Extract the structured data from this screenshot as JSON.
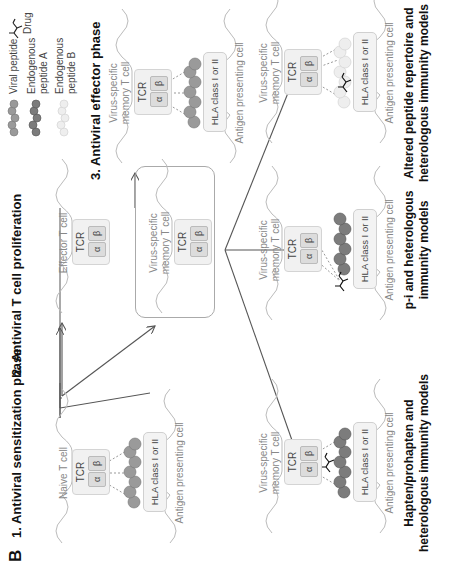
{
  "panel_letter": "B",
  "phases": {
    "phase1_title": "1. Antiviral sensitization phase",
    "phase2_title": "2. Antiviral T cell proliferation",
    "phase3_title": "3. Antiviral effector phase"
  },
  "legend": {
    "viral_peptide": "Viral peptide",
    "endogenous_a_line1": "Endogenous",
    "endogenous_a_line2": "peptide A",
    "endogenous_b_line1": "Endogenous",
    "endogenous_b_line2": "peptide B",
    "drug": "Drug",
    "colors": {
      "viral_peptide": "#9a9a9a",
      "endogenous_a": "#7c7c7c",
      "endogenous_b": "#e4e4e4"
    }
  },
  "cells": {
    "naive": {
      "line1": "Naive T cell"
    },
    "effector": {
      "line1": "Effector T cell"
    },
    "memory_center": {
      "line1": "Virus-specific",
      "line2": "memory  T cell"
    },
    "memory_phase3": {
      "line1": "Virus-specific",
      "line2": "memory  T cell"
    },
    "memory_hapten": {
      "line1": "Virus-specific",
      "line2": "memory  T cell"
    },
    "memory_pi": {
      "line1": "Virus-specific",
      "line2": "memory  T cell"
    },
    "memory_altered": {
      "line1": "Virus-specific",
      "line2": "memory  T cell"
    }
  },
  "receptor": {
    "tcr": "TCR",
    "alpha": "α",
    "beta": "β"
  },
  "hla": "HLA class I or II",
  "apc": "Antigen presenting cell",
  "models": {
    "hapten_line1": "Hapten/prohapten and",
    "hapten_line2": "heterologous immunity models",
    "pi_line1": "p-i and heterologous",
    "pi_line2": "immunity models",
    "altered_line1": "Altered peptide repertoire and",
    "altered_line2": "heterologous immunity models"
  }
}
